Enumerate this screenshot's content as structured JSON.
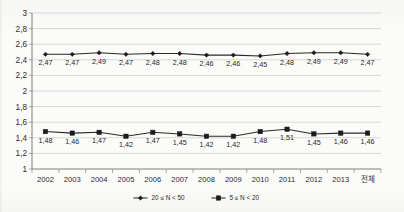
{
  "chart_data": {
    "type": "line",
    "title": "",
    "xlabel": "",
    "ylabel": "",
    "ylim": [
      1,
      3
    ],
    "ytick_step": 0.2,
    "decimal_separator": ",",
    "grid": "horizontal",
    "legend_position": "bottom-center",
    "categories": [
      "2002",
      "2003",
      "2004",
      "2005",
      "2006",
      "2007",
      "2008",
      "2009",
      "2010",
      "2011",
      "2012",
      "2013",
      "전체"
    ],
    "ytick_labels": [
      "1",
      "1,2",
      "1,4",
      "1,6",
      "1,8",
      "2",
      "2,2",
      "2,4",
      "2,6",
      "2,8",
      "3"
    ],
    "ytick_values": [
      1,
      1.2,
      1.4,
      1.6,
      1.8,
      2,
      2.2,
      2.4,
      2.6,
      2.8,
      3
    ],
    "series": [
      {
        "name": "20 ≤ N < 50",
        "marker": "diamond",
        "values": [
          2.47,
          2.47,
          2.49,
          2.47,
          2.48,
          2.48,
          2.46,
          2.46,
          2.45,
          2.48,
          2.49,
          2.49,
          2.47
        ],
        "labels": [
          "2,47",
          "2,47",
          "2,49",
          "2,47",
          "2,48",
          "2,48",
          "2,46",
          "2,46",
          "2,45",
          "2,48",
          "2,49",
          "2,49",
          "2,47"
        ]
      },
      {
        "name": "5 ≤ N < 20",
        "marker": "square",
        "values": [
          1.48,
          1.46,
          1.47,
          1.42,
          1.47,
          1.45,
          1.42,
          1.42,
          1.48,
          1.51,
          1.45,
          1.46,
          1.46
        ],
        "labels": [
          "1,48",
          "1,46",
          "1,47",
          "1,42",
          "1,47",
          "1,45",
          "1,42",
          "1,42",
          "1,48",
          "1,51",
          "1,45",
          "1,46",
          "1,46"
        ]
      }
    ]
  },
  "legend": {
    "items": [
      {
        "label": "20 ≤ N < 50",
        "marker": "diamond"
      },
      {
        "label": "5 ≤ N < 20",
        "marker": "square"
      }
    ]
  }
}
